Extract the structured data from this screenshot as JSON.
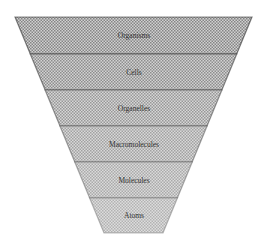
{
  "diagram": {
    "type": "inverted-pyramid",
    "levels": [
      {
        "label": "Organisms",
        "shade": "#9a9a9a"
      },
      {
        "label": "Cells",
        "shade": "#a8a8a8"
      },
      {
        "label": "Organelles",
        "shade": "#b6b6b6"
      },
      {
        "label": "Macromolecules",
        "shade": "#c0c0c0"
      },
      {
        "label": "Molecules",
        "shade": "#c8c8c8"
      },
      {
        "label": "Atoms",
        "shade": "#cfcfcf"
      }
    ],
    "outline_color": "#2a2a2a"
  }
}
